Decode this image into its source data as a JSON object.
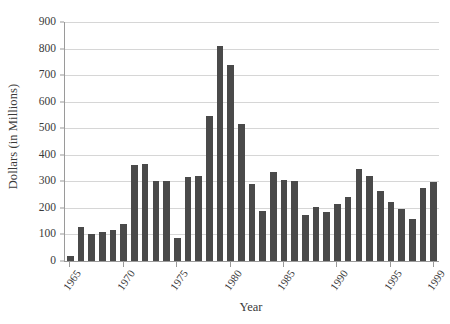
{
  "chart_data": {
    "type": "bar",
    "title": "",
    "xlabel": "Year",
    "ylabel": "Dollars (in Millions)",
    "ylim": [
      0,
      900
    ],
    "yticks": [
      0,
      100,
      200,
      300,
      400,
      500,
      600,
      700,
      800,
      900
    ],
    "ytick_labels": [
      "0",
      "100",
      "200",
      "300",
      "400",
      "500",
      "600",
      "700",
      "800",
      "900"
    ],
    "xtick_labels": [
      "1965",
      "1970",
      "1975",
      "1980",
      "1985",
      "1990",
      "1995",
      "1999"
    ],
    "xtick_years": [
      1965,
      1970,
      1975,
      1980,
      1985,
      1990,
      1995,
      1999
    ],
    "grid": true,
    "legend": "none",
    "bar_color": "#4a4a4a",
    "grid_color": "#d6d6d6",
    "axis_color": "#9a9a9a",
    "categories": [
      "1965",
      "1966",
      "1967",
      "1968",
      "1969",
      "1970",
      "1971",
      "1972",
      "1973",
      "1974",
      "1975",
      "1976",
      "1977",
      "1978",
      "1979",
      "1980",
      "1981",
      "1982",
      "1983",
      "1984",
      "1985",
      "1986",
      "1987",
      "1988",
      "1989",
      "1990",
      "1991",
      "1992",
      "1993",
      "1994",
      "1995",
      "1996",
      "1997",
      "1998",
      "1999"
    ],
    "values": [
      20,
      128,
      103,
      110,
      118,
      140,
      360,
      365,
      303,
      303,
      85,
      315,
      320,
      545,
      810,
      740,
      515,
      290,
      190,
      335,
      305,
      300,
      172,
      205,
      185,
      215,
      240,
      348,
      320,
      262,
      222,
      195,
      160,
      275,
      297
    ]
  }
}
